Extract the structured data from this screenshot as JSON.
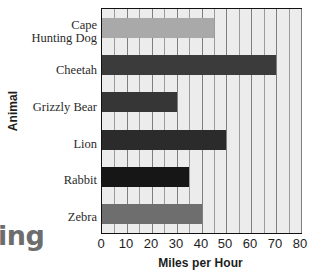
{
  "chart_data": {
    "type": "bar",
    "orientation": "horizontal",
    "title": "",
    "xlabel": "Miles per Hour",
    "ylabel": "Animal",
    "categories": [
      "Cape Hunting Dog",
      "Cheetah",
      "Grizzly Bear",
      "Lion",
      "Rabbit",
      "Zebra"
    ],
    "values": [
      45,
      70,
      30,
      50,
      35,
      40
    ],
    "xlim": [
      0,
      80
    ],
    "xticks": [
      0,
      10,
      20,
      30,
      40,
      50,
      60,
      70,
      80
    ],
    "minor_gridline_step": 5,
    "grid": true,
    "legend": false,
    "plot_background": "#ececec",
    "bar_colors": [
      "#a9a9a9",
      "#3b3b3b",
      "#363636",
      "#2b2b2b",
      "#161616",
      "#6e6e6e"
    ]
  },
  "labels": {
    "cape_hunting_dog_line1": "Cape",
    "cape_hunting_dog_line2": "Hunting Dog",
    "cheetah": "Cheetah",
    "grizzly_bear": "Grizzly Bear",
    "lion": "Lion",
    "rabbit": "Rabbit",
    "zebra": "Zebra"
  },
  "axis": {
    "y_title": "Animal",
    "x_title": "Miles per Hour",
    "tick_0": "0",
    "tick_10": "10",
    "tick_20": "20",
    "tick_30": "30",
    "tick_40": "40",
    "tick_50": "50",
    "tick_60": "60",
    "tick_70": "70",
    "tick_80": "80"
  },
  "page_bleed": {
    "bottom_left_word_fragment": "ing"
  }
}
